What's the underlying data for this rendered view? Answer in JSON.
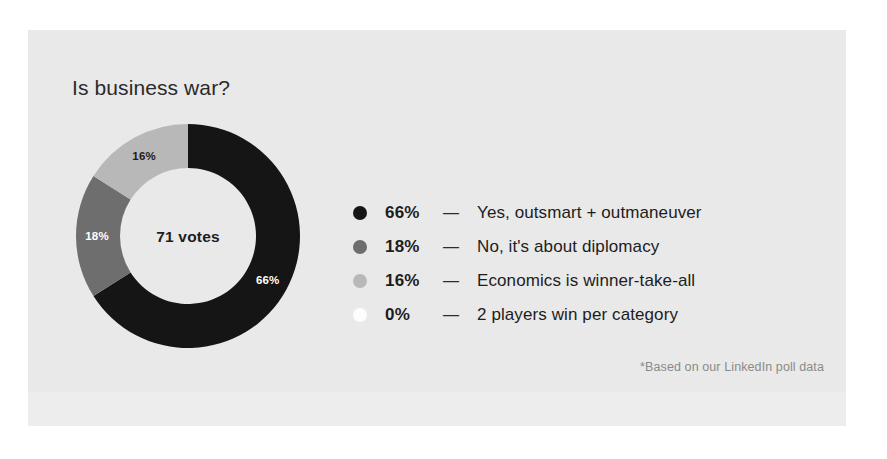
{
  "card": {
    "background_color": "#e9e9e9",
    "page_background_color": "#ffffff"
  },
  "title": "Is business war?",
  "center_label": "71 votes",
  "footnote": "*Based on our LinkedIn poll data",
  "legend": {
    "dash": "—",
    "rows": [
      {
        "percent": "66%",
        "label": "Yes, outsmart + outmaneuver",
        "color": "#151515"
      },
      {
        "percent": "18%",
        "label": "No, it's about diplomacy",
        "color": "#6e6e6e"
      },
      {
        "percent": "16%",
        "label": "Economics is winner-take-all",
        "color": "#b8b8b8"
      },
      {
        "percent": "0%",
        "label": "2 players win per category",
        "color": "#fdfdfd"
      }
    ]
  },
  "chart_data": {
    "type": "pie",
    "title": "Is business war?",
    "subtitle": "71 votes",
    "annotations": [
      "*Based on our LinkedIn poll data"
    ],
    "total_votes": 71,
    "donut": true,
    "inner_radius_ratio": 0.6,
    "start_angle_deg": 0,
    "direction": "clockwise",
    "legend_position": "right",
    "grid": false,
    "categories": [
      "Yes, outsmart + outmaneuver",
      "No, it's about diplomacy",
      "Economics is winner-take-all",
      "2 players win per category"
    ],
    "values": [
      66,
      18,
      16,
      0
    ],
    "slice_labels": [
      "66%",
      "18%",
      "16%",
      "0%"
    ],
    "colors": [
      "#151515",
      "#6e6e6e",
      "#b8b8b8",
      "#fdfdfd"
    ],
    "slice_label_colors": [
      "#ffffff",
      "#ffffff",
      "#1d1d1d",
      "#1d1d1d"
    ],
    "slices": [
      {
        "label": "Yes, outsmart + outmaneuver",
        "value": 66,
        "display": "66%",
        "color": "#151515"
      },
      {
        "label": "No, it's about diplomacy",
        "value": 18,
        "display": "18%",
        "color": "#6e6e6e"
      },
      {
        "label": "Economics is winner-take-all",
        "value": 16,
        "display": "16%",
        "color": "#b8b8b8"
      },
      {
        "label": "2 players win per category",
        "value": 0,
        "display": "0%",
        "color": "#fdfdfd"
      }
    ]
  },
  "geometry": {
    "cx": 118,
    "cy": 118,
    "r_outer": 112,
    "r_inner": 68,
    "r_label": 91
  }
}
